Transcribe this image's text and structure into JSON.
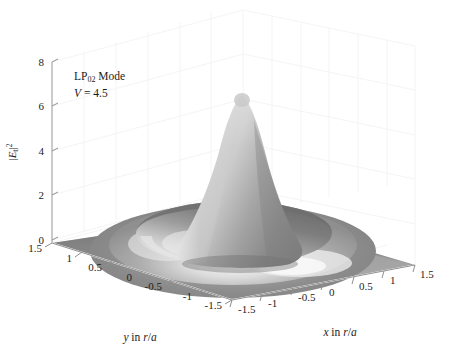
{
  "figure": {
    "kind": "3d-surface-plot",
    "background_color": "#ffffff",
    "annotations": {
      "mode_label_prefix": "LP",
      "mode_label_sub": "02",
      "mode_label_suffix": " Mode",
      "v_symbol": "V",
      "v_equals": " = 4.5",
      "v_value": 4.5
    }
  },
  "chart_data": {
    "type": "surface",
    "title": "",
    "subtitle": "",
    "xlabel": "x in r/a",
    "ylabel": "y in r/a",
    "zlabel": "|Et|^2",
    "zlabel_parts": {
      "base": "E",
      "sub": "t",
      "exp": "2"
    },
    "xlim": [
      -1.5,
      1.5
    ],
    "ylim": [
      -1.5,
      1.5
    ],
    "zlim": [
      0,
      8
    ],
    "xticks": [
      -1.5,
      -1,
      -0.5,
      0,
      0.5,
      1,
      1.5
    ],
    "xticklabels": [
      "-1.5",
      "-1",
      "-0.5",
      "0",
      "0.5",
      "1",
      "1.5"
    ],
    "yticks": [
      -1.5,
      -1,
      -0.5,
      0,
      0.5,
      1,
      1.5
    ],
    "yticklabels": [
      "-1.5",
      "-1",
      "-0.5",
      "0",
      "0.5",
      "1",
      "1.5"
    ],
    "zticks": [
      0,
      2,
      4,
      6,
      8
    ],
    "zticklabels": [
      "0",
      "2",
      "4",
      "6",
      "8"
    ],
    "grid": true,
    "legend": false,
    "colormap": "gray",
    "shading": "smooth-lighting",
    "peak_value": 6.9,
    "peak_position": [
      0,
      0
    ],
    "secondary_ring_value": 1.0,
    "secondary_ring_radius": 0.95,
    "ring_trough_value": 0.0,
    "ring_trough_radius": 0.55,
    "baseline_value": 0.0,
    "radial_profile": {
      "r": [
        0.0,
        0.05,
        0.1,
        0.15,
        0.2,
        0.25,
        0.3,
        0.35,
        0.4,
        0.45,
        0.5,
        0.55,
        0.6,
        0.65,
        0.7,
        0.75,
        0.8,
        0.85,
        0.9,
        0.95,
        1.0,
        1.05,
        1.1,
        1.15,
        1.2,
        1.3,
        1.4,
        1.5,
        1.7,
        2.0
      ],
      "intensity": [
        6.9,
        6.8,
        6.5,
        6.02,
        5.4,
        4.7,
        3.95,
        3.2,
        2.48,
        1.82,
        1.24,
        0.76,
        0.39,
        0.14,
        0.02,
        0.02,
        0.14,
        0.34,
        0.58,
        0.8,
        0.96,
        1.0,
        0.96,
        0.86,
        0.72,
        0.44,
        0.24,
        0.12,
        0.03,
        0.0
      ]
    },
    "z_levels_grid": {
      "note": "z values sampled on an 11x11 grid over x,y in [-1.5,1.5]",
      "values": [
        [
          0.0,
          0.01,
          0.02,
          0.04,
          0.05,
          0.05,
          0.05,
          0.04,
          0.02,
          0.01,
          0.0
        ],
        [
          0.01,
          0.03,
          0.08,
          0.16,
          0.23,
          0.26,
          0.23,
          0.16,
          0.08,
          0.03,
          0.01
        ],
        [
          0.02,
          0.08,
          0.24,
          0.5,
          0.74,
          0.83,
          0.74,
          0.5,
          0.24,
          0.08,
          0.02
        ],
        [
          0.04,
          0.16,
          0.5,
          0.86,
          0.6,
          0.36,
          0.6,
          0.86,
          0.5,
          0.16,
          0.04
        ],
        [
          0.05,
          0.23,
          0.74,
          0.6,
          1.82,
          4.1,
          1.82,
          0.6,
          0.74,
          0.23,
          0.05
        ],
        [
          0.05,
          0.26,
          0.83,
          0.36,
          4.1,
          6.9,
          4.1,
          0.36,
          0.83,
          0.26,
          0.05
        ],
        [
          0.05,
          0.23,
          0.74,
          0.6,
          1.82,
          4.1,
          1.82,
          0.6,
          0.74,
          0.23,
          0.05
        ],
        [
          0.04,
          0.16,
          0.5,
          0.86,
          0.6,
          0.36,
          0.6,
          0.86,
          0.5,
          0.16,
          0.04
        ],
        [
          0.02,
          0.08,
          0.24,
          0.5,
          0.74,
          0.83,
          0.74,
          0.5,
          0.24,
          0.08,
          0.02
        ],
        [
          0.01,
          0.03,
          0.08,
          0.16,
          0.23,
          0.26,
          0.23,
          0.16,
          0.08,
          0.03,
          0.01
        ],
        [
          0.0,
          0.01,
          0.02,
          0.04,
          0.05,
          0.05,
          0.05,
          0.04,
          0.02,
          0.01,
          0.0
        ]
      ]
    },
    "colors": {
      "surface_base": "#8b8b8b",
      "surface_dark": "#6f6f6f",
      "surface_light": "#d8d8d8",
      "surface_highlight": "#f2f2f2",
      "axis_line": "#9a9a9a",
      "grid_line": "#f0f0f0",
      "text": "#1a1a1a"
    }
  }
}
